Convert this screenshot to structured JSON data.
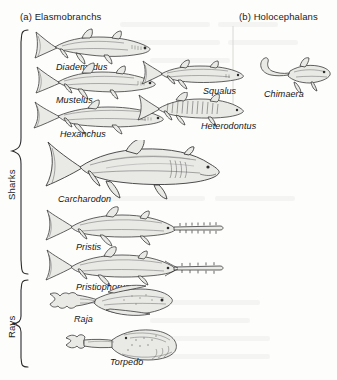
{
  "figure": {
    "panels": [
      {
        "id": "a",
        "label": "(a) Elasmobranchs"
      },
      {
        "id": "b",
        "label": "(b) Holocephalans"
      }
    ],
    "groups": [
      {
        "id": "sharks",
        "label": "Sharks"
      },
      {
        "id": "rays",
        "label": "Rays"
      }
    ],
    "taxa": [
      {
        "id": "diademodus",
        "label": "Diademodus",
        "panel": "a",
        "group": "sharks",
        "form": "shark"
      },
      {
        "id": "mustelus",
        "label": "Mustelus",
        "panel": "a",
        "group": "sharks",
        "form": "shark"
      },
      {
        "id": "hexanchus",
        "label": "Hexanchus",
        "panel": "a",
        "group": "sharks",
        "form": "shark"
      },
      {
        "id": "squalus",
        "label": "Squalus",
        "panel": "a",
        "group": "sharks",
        "form": "shark"
      },
      {
        "id": "heterodontus",
        "label": "Heterodontus",
        "panel": "a",
        "group": "sharks",
        "form": "shark"
      },
      {
        "id": "carcharodon",
        "label": "Carcharodon",
        "panel": "a",
        "group": "sharks",
        "form": "shark"
      },
      {
        "id": "pristis",
        "label": "Pristis",
        "panel": "a",
        "group": "sharks",
        "form": "sawfish"
      },
      {
        "id": "pristiophorus",
        "label": "Pristiophorus",
        "panel": "a",
        "group": "sharks",
        "form": "sawfish"
      },
      {
        "id": "raja",
        "label": "Raja",
        "panel": "a",
        "group": "rays",
        "form": "skate"
      },
      {
        "id": "torpedo",
        "label": "Torpedo",
        "panel": "a",
        "group": "rays",
        "form": "electric-ray"
      },
      {
        "id": "chimaera",
        "label": "Chimaera",
        "panel": "b",
        "group": "",
        "form": "chimaera"
      }
    ],
    "colors": {
      "ink": "#141414",
      "line": "#3a3a3a",
      "fill": "#e9e9e6",
      "background": "#fdfdfc"
    }
  }
}
